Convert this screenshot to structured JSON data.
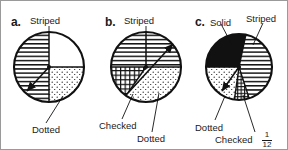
{
  "figure": {
    "title": "",
    "panels": [
      {
        "id": "a",
        "letter": "a.",
        "labels": [
          {
            "key": "striped",
            "text": "Striped"
          },
          {
            "key": "dotted",
            "text": "Dotted"
          }
        ],
        "sectors": [
          {
            "name": "Striped",
            "pattern": "horizontal-stripes",
            "start_deg": 270,
            "end_deg": 360,
            "fraction": "3/4"
          },
          {
            "name": "Dotted",
            "pattern": "dots",
            "start_deg": 0,
            "end_deg": 90,
            "fraction": "1/4"
          }
        ],
        "arrow": {
          "from": "center",
          "to_deg": 225,
          "style": "double-headed"
        }
      },
      {
        "id": "b",
        "letter": "b.",
        "labels": [
          {
            "key": "striped",
            "text": "Striped"
          },
          {
            "key": "checked",
            "text": "Checked"
          },
          {
            "key": "dotted",
            "text": "Dotted"
          }
        ],
        "sectors": [
          {
            "name": "Striped",
            "pattern": "horizontal-stripes",
            "start_deg": 0,
            "end_deg": 180,
            "fraction": "1/2"
          },
          {
            "name": "Checked",
            "pattern": "grid",
            "start_deg": 180,
            "end_deg": 235,
            "fraction": "1/6"
          },
          {
            "name": "Dotted",
            "pattern": "dots",
            "start_deg": 235,
            "end_deg": 360,
            "fraction": "1/3"
          }
        ],
        "arrow": {
          "from": "center",
          "to_deg": 40,
          "style": "single-headed"
        }
      },
      {
        "id": "c",
        "letter": "c.",
        "labels": [
          {
            "key": "solid",
            "text": "Solid"
          },
          {
            "key": "striped",
            "text": "Striped"
          },
          {
            "key": "dotted",
            "text": "Dotted"
          },
          {
            "key": "checked",
            "text": "Checked"
          }
        ],
        "fraction_annotation": {
          "numerator": "1",
          "denominator": "12"
        },
        "sectors": [
          {
            "name": "Solid",
            "pattern": "solid-black",
            "start_deg": 105,
            "end_deg": 180,
            "fraction": "1/5"
          },
          {
            "name": "Striped",
            "pattern": "horizontal-stripes",
            "start_deg": 285,
            "end_deg": 105,
            "fraction": "5/12"
          },
          {
            "name": "Dotted",
            "pattern": "dots",
            "start_deg": 180,
            "end_deg": 265,
            "fraction": "1/4"
          },
          {
            "name": "Checked",
            "pattern": "grid",
            "start_deg": 265,
            "end_deg": 285,
            "fraction": "1/12"
          }
        ],
        "arrow": {
          "from": "center",
          "to_deg": 232,
          "style": "single-headed"
        }
      }
    ]
  },
  "colors": {
    "ink": "#111111",
    "paper": "#ffffff",
    "border": "#9a9a9a"
  }
}
